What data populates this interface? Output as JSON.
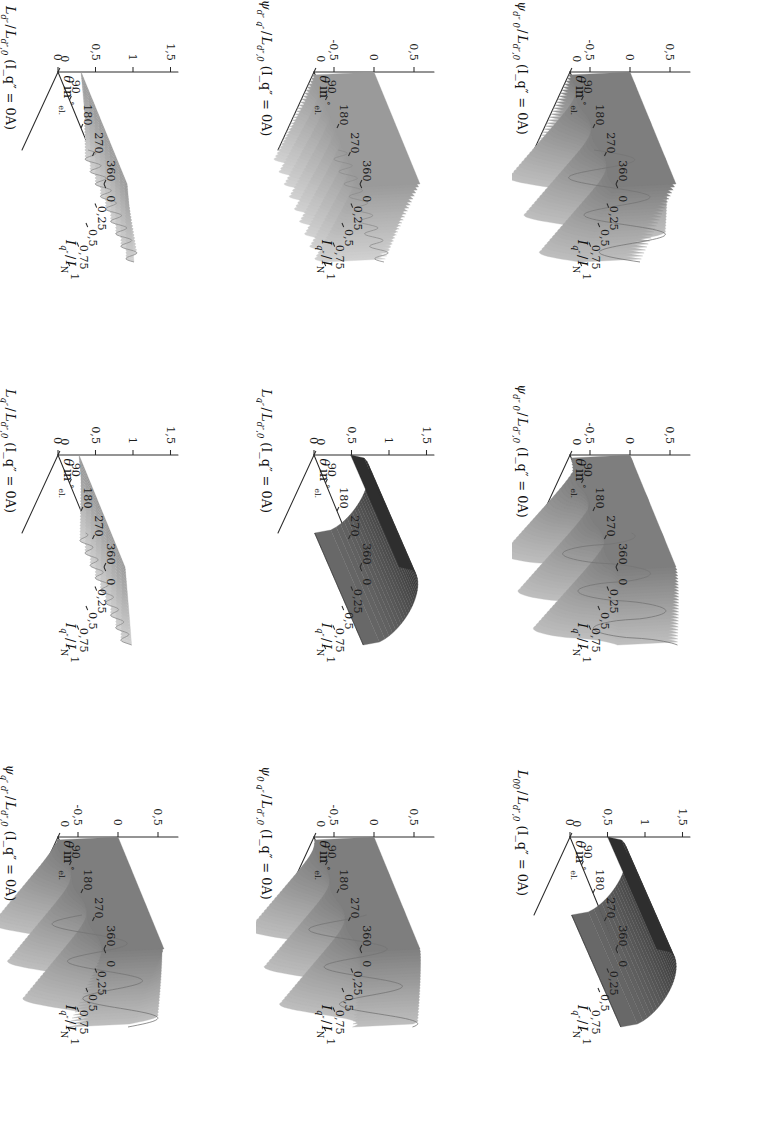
{
  "figure": {
    "kind": "surface-plot-grid",
    "rotation_deg": 90,
    "rows": 3,
    "cols": 3,
    "background": "#ffffff",
    "ink": "#1a1a1a"
  },
  "axes": {
    "x": {
      "label_theta": "θ",
      "label_in": "in",
      "label_deg": "°",
      "label_el": "el.",
      "label_full": "θ in °el.",
      "ticks": [
        "0",
        "90",
        "180",
        "270",
        "360"
      ],
      "values": [
        0,
        90,
        180,
        270,
        360
      ],
      "range": [
        0,
        360
      ]
    },
    "y": {
      "label_main": "I",
      "label_sub": "q″",
      "label_den": "I",
      "label_den_sub": "N",
      "label_full": "I_q″ / I_N",
      "ticks": [
        "0",
        "0,25",
        "0,5",
        "0,75",
        "1"
      ],
      "values": [
        0,
        0.25,
        0.5,
        0.75,
        1
      ],
      "range": [
        0,
        1
      ]
    },
    "z_pm": {
      "ticks": [
        "-0,5",
        "0",
        "0,5"
      ],
      "values": [
        -0.5,
        0,
        0.5
      ],
      "range": [
        -0.75,
        0.75
      ]
    },
    "z_pos": {
      "ticks": [
        "0",
        "0,5",
        "1",
        "1,5"
      ],
      "values": [
        0,
        0.5,
        1,
        1.5
      ],
      "range": [
        0,
        1.6
      ]
    }
  },
  "chart_data": {
    "type": "surface",
    "title": "",
    "shared": {
      "xlabel": "θ in °el.",
      "ylabel": "I_q″ / I_N",
      "x_ticks": [
        0,
        90,
        180,
        270,
        360
      ],
      "y_ticks": [
        0,
        0.25,
        0.5,
        0.75,
        1
      ],
      "grid": false,
      "legend": "none",
      "projection": "3d-mesh-surface",
      "colormap": "grayscale"
    },
    "panels": [
      {
        "id": "p11",
        "row": 1,
        "col": 1,
        "zlabel_num": "ψ",
        "zlabel_num_sub": "d″ 0",
        "zlabel_den": "L",
        "zlabel_den_sub": "d″,0",
        "zlabel_cond": "(I_q″ = 0A)",
        "zlabel_full": "ψ_d″0 / L_d″,0 (I_q″ = 0A)",
        "z_ticks": [
          -0.5,
          0,
          0.5
        ],
        "zlim": [
          -0.75,
          0.75
        ],
        "shape": "ripple-pm",
        "amplitude": 0.46,
        "cycles": 3,
        "phase": 0.0,
        "ramp": 0.0,
        "shade": "mid",
        "tilt": 0.0
      },
      {
        "id": "p12",
        "row": 1,
        "col": 2,
        "zlabel_num": "ψ",
        "zlabel_num_sub": "d″ 0",
        "zlabel_den": "L",
        "zlabel_den_sub": "d″,0",
        "zlabel_cond": "(I_q″ = 0A)",
        "zlabel_full": "ψ_d″0 / L_d″,0 (I_q″ = 0A)",
        "z_ticks": [
          -0.5,
          0,
          0.5
        ],
        "zlim": [
          -0.75,
          0.75
        ],
        "shape": "ripple-pm-sharp",
        "amplitude": 0.5,
        "cycles": 3,
        "phase": 0.18,
        "ramp": 0.0,
        "shade": "mid",
        "tilt": 0.0
      },
      {
        "id": "p13",
        "row": 1,
        "col": 3,
        "zlabel_num": "L",
        "zlabel_num_sub": "00",
        "zlabel_den": "L",
        "zlabel_den_sub": "d″,0",
        "zlabel_cond": "(I_q″ = 0A)",
        "zlabel_full": "L_00 / L_d″,0 (I_q″ = 0A)",
        "z_ticks": [
          0,
          0.5,
          1,
          1.5
        ],
        "zlim": [
          0,
          1.6
        ],
        "shape": "plateau",
        "amplitude": 0.02,
        "cycles": 0,
        "phase": 0.0,
        "ramp": 0.95,
        "shade": "dark",
        "tilt": 0.12
      },
      {
        "id": "p21",
        "row": 2,
        "col": 1,
        "zlabel_num": "ψ",
        "zlabel_num_sub": "d″ q″",
        "zlabel_den": "L",
        "zlabel_den_sub": "d″,0",
        "zlabel_cond": "(I_q″ = 0A)",
        "zlabel_full": "ψ_d″q″ / L_d″,0 (I_q″ = 0A)",
        "z_ticks": [
          -0.5,
          0,
          0.5
        ],
        "zlim": [
          -0.75,
          0.75
        ],
        "shape": "fan-ripple",
        "amplitude": 0.1,
        "cycles": 9,
        "phase": 0.0,
        "ramp": 0.0,
        "shade": "light",
        "tilt": 0.0
      },
      {
        "id": "p22",
        "row": 2,
        "col": 2,
        "zlabel_num": "L",
        "zlabel_num_sub": "q″",
        "zlabel_den": "L",
        "zlabel_den_sub": "d″,0",
        "zlabel_cond": "(I_q″ = 0A)",
        "zlabel_full": "L_q″ / L_d″,0 (I_q″ = 0A)",
        "z_ticks": [
          0,
          0.5,
          1,
          1.5
        ],
        "zlim": [
          0,
          1.6
        ],
        "shape": "plateau",
        "amplitude": 0.02,
        "cycles": 0,
        "phase": 0.0,
        "ramp": 0.92,
        "shade": "dark",
        "tilt": 0.1
      },
      {
        "id": "p23",
        "row": 2,
        "col": 3,
        "zlabel_num": "ψ",
        "zlabel_num_sub": "0 q″",
        "zlabel_den": "L",
        "zlabel_den_sub": "d″,0",
        "zlabel_cond": "(I_q″ = 0A)",
        "zlabel_full": "ψ_0q″ / L_d″,0 (I_q″ = 0A)",
        "z_ticks": [
          -0.5,
          0,
          0.5
        ],
        "zlim": [
          -0.75,
          0.75
        ],
        "shape": "ripple-pm",
        "amplitude": 0.44,
        "cycles": 3,
        "phase": 0.35,
        "ramp": 0.0,
        "shade": "mid",
        "tilt": 0.0
      },
      {
        "id": "p31",
        "row": 3,
        "col": 1,
        "zlabel_num": "L",
        "zlabel_num_sub": "d″",
        "zlabel_den": "L",
        "zlabel_den_sub": "d″,0",
        "zlabel_cond": "(I_q″ = 0A)",
        "zlabel_full": "L_d″ / L_d″,0 (I_q″ = 0A)",
        "z_ticks": [
          0,
          0.5,
          1,
          1.5
        ],
        "zlim": [
          0,
          1.6
        ],
        "shape": "fan-ripple-pos",
        "amplitude": 0.09,
        "cycles": 9,
        "phase": 0.0,
        "ramp": 0.88,
        "shade": "light",
        "tilt": 0.0
      },
      {
        "id": "p32",
        "row": 3,
        "col": 2,
        "zlabel_num": "L",
        "zlabel_num_sub": "q″",
        "zlabel_den": "L",
        "zlabel_den_sub": "d″,0",
        "zlabel_cond": "(I_q″ = 0A)",
        "zlabel_full": "L_q″ / L_d″,0 (I_q″ = 0A)",
        "z_ticks": [
          0,
          0.5,
          1,
          1.5
        ],
        "zlim": [
          0,
          1.6
        ],
        "shape": "fan-ripple-pos",
        "amplitude": 0.07,
        "cycles": 9,
        "phase": 0.12,
        "ramp": 0.8,
        "shade": "light",
        "tilt": 0.0
      },
      {
        "id": "p33",
        "row": 3,
        "col": 3,
        "zlabel_num": "ψ",
        "zlabel_num_sub": "q″ d″",
        "zlabel_den": "L",
        "zlabel_den_sub": "d″,0",
        "zlabel_cond": "(I_q″ = 0A)",
        "zlabel_full": "ψ_q″d″ / L_d″,0 (I_q″ = 0A)",
        "z_ticks": [
          -0.5,
          0,
          0.5
        ],
        "zlim": [
          -0.75,
          0.75
        ],
        "shape": "ripple-pm",
        "amplitude": 0.42,
        "cycles": 3,
        "phase": 0.5,
        "ramp": 0.0,
        "shade": "mid",
        "tilt": 0.0
      }
    ]
  }
}
